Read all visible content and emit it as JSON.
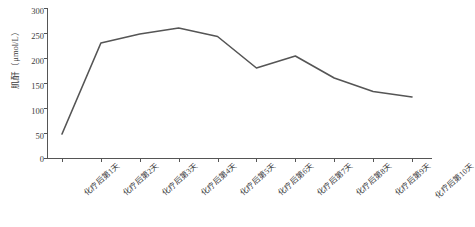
{
  "chart_data": {
    "type": "line",
    "title": "",
    "xlabel": "",
    "ylabel": "肌酐（μmol/L）",
    "categories": [
      "化疗后第1天",
      "化疗后第2天",
      "化疗后第3天",
      "化疗后第4天",
      "化疗后第5天",
      "化疗后第6天",
      "化疗后第7天",
      "化疗后第8天",
      "化疗后第9天",
      "化疗后第10天"
    ],
    "values": [
      48,
      230,
      248,
      260,
      243,
      180,
      204,
      160,
      133,
      122
    ],
    "ylim": [
      0,
      300
    ],
    "yticks": [
      0,
      50,
      100,
      150,
      200,
      250,
      300
    ],
    "ytick_labels": [
      "0",
      "50",
      "100",
      "150",
      "200",
      "250",
      "300"
    ],
    "grid": false,
    "legend": false,
    "markers": false,
    "line_color": "#555555"
  },
  "axis": {
    "y_title": "肌酐（μmol/L）",
    "tick_labels": [
      "300",
      "250",
      "200",
      "150",
      "100",
      "50",
      "0"
    ]
  }
}
